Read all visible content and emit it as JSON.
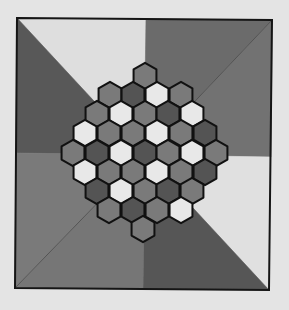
{
  "page": {
    "background": "#e4e4e4"
  },
  "board": {
    "frame": {
      "corners": [
        [
          17,
          18
        ],
        [
          272,
          20
        ],
        [
          269,
          290
        ],
        [
          15,
          288
        ]
      ],
      "stroke": "#151515",
      "stroke_width": 2
    },
    "center": [
      144,
      155
    ],
    "edge_midpoints": {
      "top": [
        146,
        19
      ],
      "right": [
        271,
        157
      ],
      "bottom": [
        143,
        289
      ],
      "left": [
        16,
        153
      ]
    },
    "sectors": [
      {
        "name": "top-left-upper",
        "points": [
          "top_left",
          "top",
          "center"
        ],
        "color": "#dedede"
      },
      {
        "name": "top-left-lower",
        "points": [
          "top_left",
          "center",
          "left"
        ],
        "color": "#585858"
      },
      {
        "name": "top-right-upper",
        "points": [
          "top",
          "top_right",
          "center"
        ],
        "color": "#6b6b6b"
      },
      {
        "name": "top-right-lower",
        "points": [
          "top_right",
          "right",
          "center"
        ],
        "color": "#727272"
      },
      {
        "name": "bottom-right-upper",
        "points": [
          "right",
          "bottom_right",
          "center"
        ],
        "color": "#e0e0e0"
      },
      {
        "name": "bottom-right-lower",
        "points": [
          "bottom_right",
          "bottom",
          "center"
        ],
        "color": "#565656"
      },
      {
        "name": "bottom-left-lower",
        "points": [
          "bottom",
          "bottom_left",
          "center"
        ],
        "color": "#767676"
      },
      {
        "name": "bottom-left-upper",
        "points": [
          "bottom_left",
          "left",
          "center"
        ],
        "color": "#7a7a7a"
      }
    ],
    "diagonal_line_color": "#4a4a4a",
    "hex": {
      "radius": 13.2,
      "stroke": "#111111",
      "stroke_width": 2,
      "colors": {
        "W": "#e8e8e8",
        "M": "#7a7a7a",
        "D": "#545454"
      }
    },
    "rows": [
      {
        "y": 76,
        "x": [
          145
        ],
        "cells": [
          "M"
        ]
      },
      {
        "y": 95,
        "x": [
          110,
          133,
          157,
          181
        ],
        "cells": [
          "M",
          "D",
          "W",
          "M"
        ]
      },
      {
        "y": 114,
        "x": [
          97,
          121,
          145,
          168,
          192
        ],
        "cells": [
          "M",
          "W",
          "M",
          "D",
          "W"
        ]
      },
      {
        "y": 133,
        "x": [
          85,
          109,
          133,
          157,
          181,
          205
        ],
        "cells": [
          "W",
          "M",
          "M",
          "W",
          "M",
          "D"
        ]
      },
      {
        "y": 153,
        "x": [
          73,
          97,
          121,
          145,
          168,
          192,
          216
        ],
        "cells": [
          "M",
          "D",
          "W",
          "D",
          "M",
          "W",
          "M"
        ]
      },
      {
        "y": 172,
        "x": [
          85,
          109,
          133,
          157,
          181,
          205
        ],
        "cells": [
          "W",
          "M",
          "M",
          "W",
          "M",
          "D"
        ]
      },
      {
        "y": 191,
        "x": [
          97,
          121,
          145,
          168,
          192
        ],
        "cells": [
          "D",
          "W",
          "M",
          "D",
          "M"
        ]
      },
      {
        "y": 210,
        "x": [
          109,
          133,
          157,
          181
        ],
        "cells": [
          "M",
          "D",
          "M",
          "W"
        ]
      },
      {
        "y": 229,
        "x": [
          143
        ],
        "cells": [
          "M"
        ]
      }
    ]
  }
}
